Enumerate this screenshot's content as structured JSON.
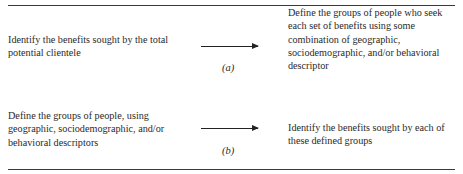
{
  "panel_a": {
    "left_text": "Identify the benefits sought by the total potential clientele",
    "right_text": "Define the groups of people who seek each set of benefits using some combination of geographic, sociodemographic, and/or behavioral descriptor",
    "label": "(a)"
  },
  "panel_b": {
    "left_text": "Define the groups of people, using geographic, sociodemographic, and/or behavioral descriptors",
    "right_text": "Identify the benefits sought by each of these defined groups",
    "label": "(b)"
  }
}
